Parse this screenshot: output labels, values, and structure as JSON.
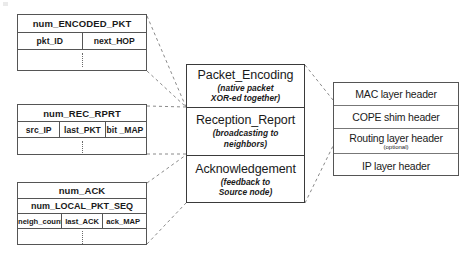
{
  "diagram": {
    "style": {
      "background": "#ffffff",
      "line_color": "#555555",
      "text_color": "#1a1a1a"
    }
  },
  "tables": [
    {
      "id": "encoded-pkt",
      "name": "num_ENCODED_PKT",
      "title": "num_ENCODED_PKT",
      "columns": [
        "pkt_ID",
        "next_HOP"
      ],
      "has_continuation_row": true
    },
    {
      "id": "rec-rprt",
      "name": "num_REC_RPRT",
      "title": "num_REC_RPRT",
      "columns": [
        "src_IP",
        "last_PKT",
        "bit _MAP"
      ],
      "has_continuation_row": true
    },
    {
      "id": "ack",
      "name": "num_ACK",
      "title": "num_ACK",
      "subtitle": "num_LOCAL_PKT_SEQ",
      "columns": [
        "neigh_count",
        "last_ACK",
        "ack_MAP"
      ],
      "has_continuation_row": true
    }
  ],
  "modules": [
    {
      "id": "packet-encoding",
      "title": "Packet_Encoding",
      "sub_line1": "(native packet",
      "sub_line2": "XOR-ed  together)"
    },
    {
      "id": "reception-report",
      "title": "Reception_Report",
      "sub_line1": "(broadcasting to",
      "sub_line2": "neighbors)"
    },
    {
      "id": "acknowledgement",
      "title": "Acknowledgement",
      "sub_line1": "(feedback to",
      "sub_line2": "Source node)"
    }
  ],
  "headers": [
    {
      "id": "mac-layer",
      "title": "MAC layer header",
      "note": ""
    },
    {
      "id": "cope-shim",
      "title": "COPE shim header",
      "note": ""
    },
    {
      "id": "routing-layer",
      "title": "Routing layer header",
      "note": "(optional)"
    },
    {
      "id": "ip-layer",
      "title": "IP layer header",
      "note": ""
    }
  ]
}
